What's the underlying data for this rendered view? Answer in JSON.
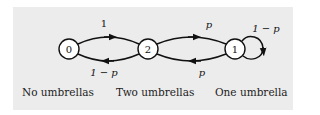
{
  "diagram": {
    "type": "markov-chain",
    "background": "#ececec",
    "nodes": [
      {
        "id": "0",
        "label": "0",
        "cx": 69,
        "cy": 49,
        "caption": "No umbrellas"
      },
      {
        "id": "2",
        "label": "2",
        "cx": 148,
        "cy": 49,
        "caption": "Two umbrellas"
      },
      {
        "id": "1",
        "label": "1",
        "cx": 235,
        "cy": 49,
        "caption": "One umbrella"
      }
    ],
    "edges": [
      {
        "from": "0",
        "to": "2",
        "label": "1"
      },
      {
        "from": "2",
        "to": "0",
        "label": "1 − p"
      },
      {
        "from": "2",
        "to": "1",
        "label": "p"
      },
      {
        "from": "1",
        "to": "2",
        "label": "p"
      },
      {
        "from": "1",
        "to": "1",
        "label": "1 − p"
      }
    ]
  }
}
